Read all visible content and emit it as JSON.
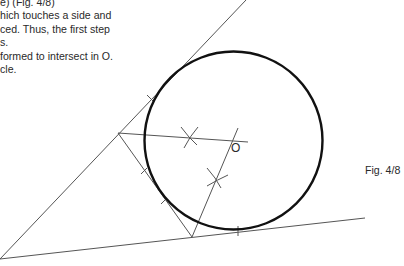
{
  "text": {
    "lines": [
      "e) (Fig. 4/8)",
      "hich touches a side and",
      "ced. Thus, the first step",
      "s.",
      " formed to intersect in O.",
      "cle."
    ]
  },
  "figure": {
    "caption": "Fig. 4/8",
    "center_label": "O",
    "stroke_color": "#555555",
    "circle_color": "#111111",
    "circle": {
      "cx": 233.5,
      "cy": 140.5,
      "r": 89
    },
    "lines": {
      "upper_side": {
        "x1": 0,
        "y1": 259,
        "x2": 246,
        "y2": 0
      },
      "lower_side": {
        "x1": 0,
        "y1": 259,
        "x2": 365,
        "y2": 218
      },
      "transversal": {
        "x1": 118,
        "y1": 133,
        "x2": 192,
        "y2": 237
      },
      "bisector_a": {
        "x1": 118,
        "y1": 133,
        "x2": 248,
        "y2": 142
      },
      "bisector_b": {
        "x1": 192,
        "y1": 237,
        "x2": 238,
        "y2": 128
      }
    }
  }
}
